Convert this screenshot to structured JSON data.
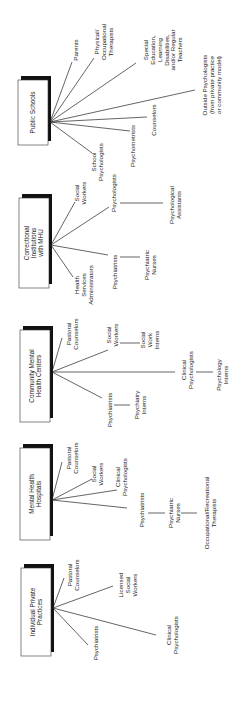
{
  "diagram": {
    "orientation": "rotated-90-ccw",
    "settings": [
      {
        "id": "public-schools",
        "label": [
          "Public Schools"
        ],
        "roles": [
          {
            "label": [
              "Parents"
            ]
          },
          {
            "label": [
              "Physical/",
              "Occupational",
              "Therapists"
            ]
          },
          {
            "label": [
              "Special",
              "Education,",
              "Learning",
              "Disabilities,",
              "and/or Regular",
              "Teachers"
            ]
          },
          {
            "label": [
              "Outside Psychologists",
              "(from private practice",
              "or community model)"
            ]
          },
          {
            "label": [
              "Counselors"
            ]
          },
          {
            "label": [
              "Psychometrists"
            ]
          },
          {
            "label": [
              "School",
              "Psychologists"
            ]
          }
        ]
      },
      {
        "id": "correctional-institutions",
        "label": [
          "Correctional",
          "Institutions",
          "with MHU"
        ],
        "roles": [
          {
            "label": [
              "Social",
              "Workers"
            ]
          },
          {
            "label": [
              "Psychologists"
            ],
            "sub": [
              "Psychological",
              "Assistants"
            ]
          },
          {
            "label": [
              "Psychiatrists"
            ],
            "sub": [
              "Psychiatric",
              "Nurses"
            ]
          },
          {
            "label": [
              "Health",
              "Services",
              "Administrators"
            ]
          }
        ]
      },
      {
        "id": "community-mental-health-centers",
        "label": [
          "Community Mental",
          "Health Centers"
        ],
        "roles": [
          {
            "label": [
              "Pastoral",
              "Counselors"
            ]
          },
          {
            "label": [
              "Social",
              "Workers"
            ],
            "sub": [
              "Social",
              "Work",
              "Interns"
            ]
          },
          {
            "label": [
              "Clinical",
              "Psychologists"
            ],
            "sub": [
              "Psychology",
              "Interns"
            ]
          },
          {
            "label": [
              "Psychiatrists"
            ],
            "sub": [
              "Psychiatry",
              "Interns"
            ]
          }
        ]
      },
      {
        "id": "mental-health-hospitals",
        "label": [
          "Mental Health",
          "Hospitals"
        ],
        "roles": [
          {
            "label": [
              "Pastoral",
              "Counselors"
            ]
          },
          {
            "label": [
              "Social",
              "Workers"
            ]
          },
          {
            "label": [
              "Clinical",
              "Psychologists"
            ]
          },
          {
            "label": [
              "Psychiatrists"
            ],
            "sub": [
              "Psychiatric",
              "Nurses"
            ],
            "sub2": [
              "Occupational/Recreational",
              "Therapists"
            ]
          }
        ]
      },
      {
        "id": "individual-private-practices",
        "label": [
          "Individual Private",
          "Practices"
        ],
        "roles": [
          {
            "label": [
              "Pastoral",
              "Counselors"
            ]
          },
          {
            "label": [
              "Licensed",
              "Social",
              "Workers"
            ]
          },
          {
            "label": [
              "Clinical",
              "Psychologists"
            ]
          },
          {
            "label": [
              "Psychiatrists"
            ]
          }
        ]
      }
    ]
  }
}
